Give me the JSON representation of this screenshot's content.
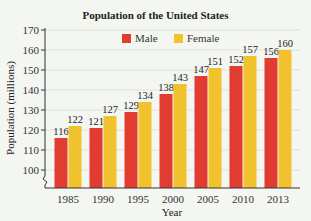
{
  "chart_data": {
    "type": "bar",
    "title": "Population of the United States",
    "xlabel": "Year",
    "ylabel": "Population (millions)",
    "categories": [
      "1985",
      "1990",
      "1995",
      "2000",
      "2005",
      "2010",
      "2013"
    ],
    "series": [
      {
        "name": "Male",
        "color": "#e03c31",
        "values": [
          116,
          121,
          129,
          138,
          147,
          152,
          156
        ]
      },
      {
        "name": "Female",
        "color": "#f2c12e",
        "values": [
          122,
          127,
          134,
          143,
          151,
          157,
          160
        ]
      }
    ],
    "ylim": [
      100,
      170
    ],
    "yticks": [
      100,
      110,
      120,
      130,
      140,
      150,
      160,
      170
    ],
    "axis_break": true,
    "grid": true,
    "legend_position": "top"
  }
}
